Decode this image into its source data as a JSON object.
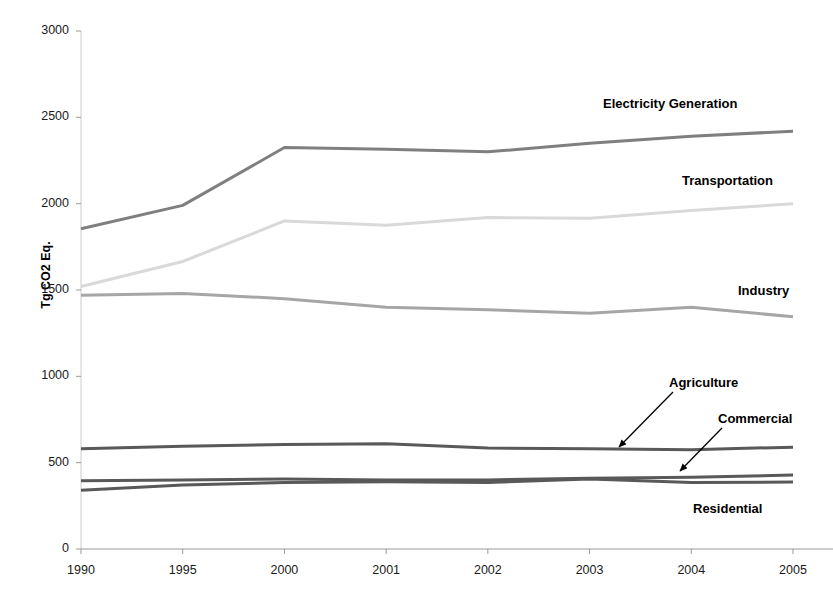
{
  "chart_data": {
    "type": "line",
    "title": "",
    "xlabel": "",
    "ylabel": "Tg CO2 Eq.",
    "categories": [
      "1990",
      "1995",
      "2000",
      "2001",
      "2002",
      "2003",
      "2004",
      "2005"
    ],
    "ylim": [
      0,
      3000
    ],
    "yticks": [
      0,
      500,
      1000,
      1500,
      2000,
      2500,
      3000
    ],
    "ytick_labels": [
      "0",
      "500",
      "1000",
      "1500",
      "2000",
      "2500",
      "3000"
    ],
    "grid": false,
    "legend_position": "inline-annotations",
    "series": [
      {
        "name": "Electricity Generation",
        "color": "#7f7f7f",
        "values": [
          1855,
          1990,
          2325,
          2315,
          2300,
          2350,
          2390,
          2420
        ]
      },
      {
        "name": "Transportation",
        "color": "#d9d9d9",
        "values": [
          1520,
          1665,
          1900,
          1875,
          1920,
          1915,
          1960,
          2000
        ]
      },
      {
        "name": "Industry",
        "color": "#a6a6a6",
        "values": [
          1470,
          1480,
          1450,
          1400,
          1385,
          1365,
          1400,
          1345
        ]
      },
      {
        "name": "Agriculture",
        "color": "#595959",
        "values": [
          580,
          595,
          605,
          610,
          585,
          580,
          575,
          590
        ]
      },
      {
        "name": "Commercial",
        "color": "#595959",
        "values": [
          395,
          400,
          405,
          400,
          400,
          410,
          415,
          428
        ]
      },
      {
        "name": "Residential",
        "color": "#595959",
        "values": [
          340,
          370,
          385,
          390,
          385,
          405,
          385,
          388
        ]
      }
    ],
    "annotations": [
      {
        "text": "Electricity Generation",
        "x_px": 603,
        "y_px": 96,
        "arrow": false
      },
      {
        "text": "Transportation",
        "x_px": 682,
        "y_px": 173,
        "arrow": false
      },
      {
        "text": "Industry",
        "x_px": 738,
        "y_px": 283,
        "arrow": false
      },
      {
        "text": "Agriculture",
        "x_px": 669,
        "y_px": 375,
        "arrow": true,
        "tip_x_px": 619,
        "tip_y_px": 447
      },
      {
        "text": "Commercial",
        "x_px": 718,
        "y_px": 411,
        "arrow": true,
        "tip_x_px": 680,
        "tip_y_px": 471
      },
      {
        "text": "Residential",
        "x_px": 693,
        "y_px": 501,
        "arrow": false
      }
    ]
  },
  "axis": {
    "y_label_text": "Tg CO2 Eq.",
    "y_ticks": [
      "3000",
      "2500",
      "2000",
      "1500",
      "1000",
      "500",
      "0"
    ],
    "x_ticks": [
      "1990",
      "1995",
      "2000",
      "2001",
      "2002",
      "2003",
      "2004",
      "2005"
    ]
  },
  "geometry": {
    "plot_left": 81,
    "plot_right": 793,
    "plot_top": 31,
    "plot_bottom": 549
  }
}
